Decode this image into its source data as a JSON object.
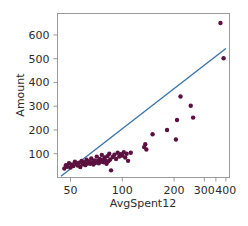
{
  "chart_data": {
    "type": "scatter",
    "title": "",
    "xlabel": "AvgSpent12",
    "ylabel": "Amount",
    "xscale": "log",
    "yscale": "linear",
    "xlim": [
      42,
      420
    ],
    "ylim": [
      0,
      690
    ],
    "grid": false,
    "legend": null,
    "point_color": "#5b1140",
    "line_color": "#3a74a8",
    "xticks": [
      {
        "value": 50,
        "label": "50"
      },
      {
        "value": 100,
        "label": "100"
      },
      {
        "value": 200,
        "label": "200"
      },
      {
        "value": 300,
        "label": "300"
      },
      {
        "value": 400,
        "label": "400"
      }
    ],
    "xticks_minor": [
      350
    ],
    "yticks": [
      {
        "value": 100,
        "label": "100"
      },
      {
        "value": 200,
        "label": "200"
      },
      {
        "value": 300,
        "label": "300"
      },
      {
        "value": 400,
        "label": "400"
      },
      {
        "value": 500,
        "label": "500"
      },
      {
        "value": 600,
        "label": "600"
      }
    ],
    "series": [
      {
        "name": "observations",
        "color": "#5b1140",
        "points": [
          [
            46,
            38
          ],
          [
            47,
            52
          ],
          [
            48,
            45
          ],
          [
            49,
            60
          ],
          [
            50,
            42
          ],
          [
            51,
            55
          ],
          [
            52,
            48
          ],
          [
            53,
            66
          ],
          [
            54,
            58
          ],
          [
            55,
            50
          ],
          [
            56,
            62
          ],
          [
            57,
            44
          ],
          [
            58,
            70
          ],
          [
            59,
            56
          ],
          [
            60,
            64
          ],
          [
            61,
            52
          ],
          [
            62,
            75
          ],
          [
            63,
            60
          ],
          [
            64,
            68
          ],
          [
            65,
            58
          ],
          [
            66,
            80
          ],
          [
            67,
            64
          ],
          [
            68,
            55
          ],
          [
            69,
            72
          ],
          [
            70,
            62
          ],
          [
            71,
            88
          ],
          [
            72,
            70
          ],
          [
            73,
            60
          ],
          [
            74,
            78
          ],
          [
            75,
            66
          ],
          [
            76,
            95
          ],
          [
            77,
            74
          ],
          [
            78,
            64
          ],
          [
            79,
            84
          ],
          [
            80,
            72
          ],
          [
            81,
            58
          ],
          [
            82,
            90
          ],
          [
            83,
            68
          ],
          [
            84,
            100
          ],
          [
            85,
            76
          ],
          [
            86,
            30
          ],
          [
            88,
            86
          ],
          [
            90,
            96
          ],
          [
            92,
            78
          ],
          [
            94,
            104
          ],
          [
            96,
            88
          ],
          [
            98,
            98
          ],
          [
            100,
            92
          ],
          [
            102,
            106
          ],
          [
            104,
            84
          ],
          [
            106,
            100
          ],
          [
            108,
            70
          ],
          [
            112,
            104
          ],
          [
            134,
            128
          ],
          [
            136,
            140
          ],
          [
            138,
            118
          ],
          [
            150,
            182
          ],
          [
            182,
            200
          ],
          [
            205,
            160
          ],
          [
            208,
            242
          ],
          [
            218,
            341
          ],
          [
            250,
            302
          ],
          [
            258,
            252
          ],
          [
            372,
            650
          ],
          [
            388,
            502
          ]
        ]
      }
    ],
    "fit_line": {
      "name": "regression",
      "color": "#3a74a8",
      "x1": 44,
      "y1": 5,
      "x2": 400,
      "y2": 543
    }
  }
}
